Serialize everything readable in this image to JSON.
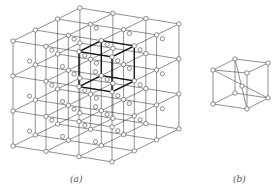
{
  "figure_a": {
    "label": "(a)",
    "type": "face-centered cubic lattice, 3x3x3 cells",
    "grid_nodes_per_axis": 4,
    "origin": [
      13,
      41
    ],
    "step_x": [
      33,
      5.3
    ],
    "step_y": [
      0,
      35
    ],
    "step_z": [
      22.3,
      -11
    ],
    "highlighted_cell": {
      "col": 2,
      "row": 0,
      "depth": 0
    },
    "line_color": "#444444",
    "highlight_color": "#111111"
  },
  "figure_b": {
    "label": "(b)",
    "type": "body-centered cubic unit cell",
    "corners": {
      "ftl": [
        213,
        70
      ],
      "ftr": [
        247,
        73
      ],
      "fbl": [
        213,
        104
      ],
      "fbr": [
        247,
        109
      ],
      "btl": [
        235,
        59
      ],
      "btr": [
        268,
        63
      ],
      "bbl": [
        235,
        93
      ],
      "bbr": [
        268,
        98
      ]
    },
    "center": [
      242,
      86
    ]
  }
}
